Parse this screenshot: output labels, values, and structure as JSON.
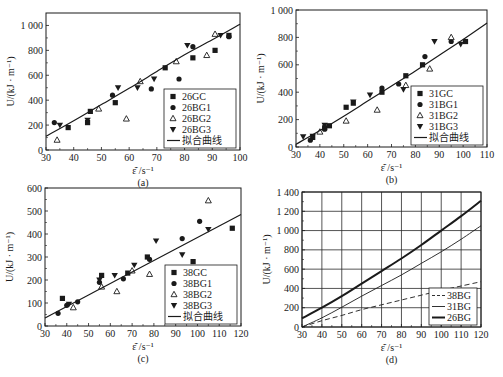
{
  "figure": {
    "panels": [
      "a",
      "b",
      "c",
      "d"
    ]
  },
  "chart_data": [
    {
      "id": "a",
      "type": "scatter",
      "caption": "(a)",
      "xlabel": "ε̄̇ /s⁻¹",
      "ylabel": "U/(kJ · m⁻¹)",
      "xlim": [
        30,
        100
      ],
      "ylim": [
        0,
        1100
      ],
      "xticks": [
        30,
        40,
        50,
        60,
        70,
        80,
        90,
        100
      ],
      "yticks": [
        0,
        200,
        400,
        600,
        800,
        1000
      ],
      "ytick_labels": [
        "0",
        "200",
        "400",
        "600",
        "800",
        "1 000"
      ],
      "frame": {
        "left": 46,
        "top": 13,
        "right": 240,
        "bottom": 150
      },
      "legend": {
        "position": "lower right",
        "entries": [
          "26GC",
          "26BG1",
          "26BG2",
          "26BG3",
          "拟合曲线"
        ]
      },
      "series": [
        {
          "name": "26GC",
          "marker": "square",
          "points": [
            [
              38,
              180
            ],
            [
              45,
              220
            ],
            [
              46,
              310
            ],
            [
              55,
              380
            ],
            [
              73,
              660
            ],
            [
              83,
              740
            ],
            [
              91,
              800
            ],
            [
              96,
              920
            ]
          ]
        },
        {
          "name": "26BG1",
          "marker": "circle",
          "points": [
            [
              33,
              220
            ],
            [
              54,
              440
            ],
            [
              68,
              490
            ],
            [
              78,
              570
            ],
            [
              83,
              830
            ],
            [
              96,
              910
            ]
          ]
        },
        {
          "name": "26BG2",
          "marker": "triangle-up",
          "points": [
            [
              34,
              80
            ],
            [
              49,
              330
            ],
            [
              59,
              250
            ],
            [
              64,
              550
            ],
            [
              77,
              710
            ],
            [
              88,
              760
            ],
            [
              91,
              930
            ]
          ]
        },
        {
          "name": "26BG3",
          "marker": "triangle-down",
          "points": [
            [
              35,
              200
            ],
            [
              45,
              240
            ],
            [
              56,
              500
            ],
            [
              63,
              500
            ],
            [
              69,
              570
            ],
            [
              81,
              840
            ],
            [
              93,
              920
            ]
          ]
        },
        {
          "name": "拟合曲线",
          "marker": "line",
          "points": [
            [
              30,
              110
            ],
            [
              40,
              235
            ],
            [
              50,
              365
            ],
            [
              60,
              495
            ],
            [
              70,
              630
            ],
            [
              80,
              765
            ],
            [
              90,
              885
            ],
            [
              100,
              1010
            ]
          ]
        }
      ]
    },
    {
      "id": "b",
      "type": "scatter",
      "caption": "(b)",
      "xlabel": "ε̄̇ /s⁻¹",
      "ylabel": "U/(kJ · m⁻¹)",
      "xlim": [
        30,
        110
      ],
      "ylim": [
        0,
        1000
      ],
      "xticks": [
        30,
        40,
        50,
        60,
        70,
        80,
        90,
        100,
        110
      ],
      "yticks": [
        0,
        200,
        400,
        600,
        800,
        1000
      ],
      "ytick_labels": [
        "0",
        "200",
        "400",
        "600",
        "800",
        "1 000"
      ],
      "frame": {
        "left": 296,
        "top": 10,
        "right": 487,
        "bottom": 147
      },
      "legend": {
        "position": "lower right",
        "entries": [
          "31GC",
          "31BG1",
          "31BG2",
          "31BG3",
          "拟合曲线"
        ]
      },
      "series": [
        {
          "name": "31GC",
          "marker": "square",
          "points": [
            [
              37,
              70
            ],
            [
              42,
              140
            ],
            [
              44,
              155
            ],
            [
              51,
              290
            ],
            [
              54,
              320
            ],
            [
              66,
              400
            ],
            [
              76,
              520
            ],
            [
              83,
              600
            ],
            [
              101,
              770
            ]
          ]
        },
        {
          "name": "31BG1",
          "marker": "circle",
          "points": [
            [
              36,
              50
            ],
            [
              42,
              130
            ],
            [
              66,
              430
            ],
            [
              73,
              460
            ],
            [
              84,
              660
            ],
            [
              95,
              770
            ]
          ]
        },
        {
          "name": "31BG2",
          "marker": "triangle-up",
          "points": [
            [
              40,
              110
            ],
            [
              51,
              190
            ],
            [
              64,
              270
            ],
            [
              76,
              450
            ],
            [
              86,
              570
            ],
            [
              95,
              800
            ]
          ]
        },
        {
          "name": "31BG3",
          "marker": "triangle-down",
          "points": [
            [
              33,
              75
            ],
            [
              37,
              80
            ],
            [
              42,
              160
            ],
            [
              54,
              330
            ],
            [
              61,
              380
            ],
            [
              75,
              420
            ],
            [
              88,
              770
            ],
            [
              99,
              750
            ]
          ]
        },
        {
          "name": "拟合曲线",
          "marker": "line",
          "points": [
            [
              30,
              20
            ],
            [
              40,
              120
            ],
            [
              50,
              225
            ],
            [
              60,
              335
            ],
            [
              70,
              445
            ],
            [
              80,
              555
            ],
            [
              90,
              670
            ],
            [
              100,
              785
            ],
            [
              110,
              905
            ]
          ]
        }
      ]
    },
    {
      "id": "c",
      "type": "scatter",
      "caption": "(c)",
      "xlabel": "ε̄̇ /s⁻¹",
      "ylabel": "U/(kJ · m⁻¹)",
      "xlim": [
        30,
        120
      ],
      "ylim": [
        0,
        600
      ],
      "xticks": [
        30,
        40,
        50,
        60,
        70,
        80,
        90,
        100,
        110,
        120
      ],
      "yticks": [
        0,
        100,
        200,
        300,
        400,
        500,
        600
      ],
      "ytick_labels": [
        "0",
        "100",
        "200",
        "300",
        "400",
        "500",
        "600"
      ],
      "frame": {
        "left": 45,
        "top": 188,
        "right": 241,
        "bottom": 326
      },
      "legend": {
        "position": "lower right",
        "entries": [
          "38GC",
          "38BG1",
          "38BG2",
          "38BG3",
          "拟合曲线"
        ]
      },
      "series": [
        {
          "name": "38GC",
          "marker": "square",
          "points": [
            [
              38,
              120
            ],
            [
              56,
              220
            ],
            [
              68,
              230
            ],
            [
              77,
              300
            ],
            [
              98,
              280
            ],
            [
              116,
              425
            ]
          ]
        },
        {
          "name": "38BG1",
          "marker": "circle",
          "points": [
            [
              36,
              55
            ],
            [
              40,
              90
            ],
            [
              45,
              105
            ],
            [
              55,
              190
            ],
            [
              66,
              205
            ],
            [
              78,
              290
            ],
            [
              93,
              380
            ],
            [
              101,
              455
            ]
          ]
        },
        {
          "name": "38BG2",
          "marker": "triangle-up",
          "points": [
            [
              43,
              80
            ],
            [
              56,
              170
            ],
            [
              63,
              150
            ],
            [
              70,
              240
            ],
            [
              78,
              225
            ],
            [
              105,
              545
            ]
          ]
        },
        {
          "name": "38BG3",
          "marker": "triangle-down",
          "points": [
            [
              41,
              95
            ],
            [
              55,
              200
            ],
            [
              62,
              220
            ],
            [
              71,
              265
            ],
            [
              81,
              370
            ],
            [
              93,
              310
            ],
            [
              105,
              420
            ]
          ]
        },
        {
          "name": "拟合曲线",
          "marker": "line",
          "points": [
            [
              30,
              35
            ],
            [
              40,
              85
            ],
            [
              50,
              135
            ],
            [
              60,
              185
            ],
            [
              70,
              235
            ],
            [
              80,
              285
            ],
            [
              90,
              335
            ],
            [
              100,
              385
            ],
            [
              110,
              435
            ],
            [
              120,
              485
            ]
          ]
        }
      ]
    },
    {
      "id": "d",
      "type": "line",
      "caption": "(d)",
      "xlabel": "ε̄̇ /s⁻¹",
      "ylabel": "U/(kJ · m⁻¹)",
      "xlim": [
        30,
        120
      ],
      "ylim": [
        0,
        1400
      ],
      "grid": true,
      "xticks": [
        30,
        40,
        50,
        60,
        70,
        80,
        90,
        100,
        110,
        120
      ],
      "yticks": [
        0,
        200,
        400,
        600,
        800,
        1000,
        1200,
        1400
      ],
      "ytick_labels": [
        "0",
        "200",
        "400",
        "600",
        "800",
        "1 000",
        "1 200",
        "1 400"
      ],
      "frame": {
        "left": 302,
        "top": 192,
        "right": 481,
        "bottom": 327
      },
      "legend": {
        "position": "lower right",
        "entries": [
          "38BG",
          "31BG",
          "26BG"
        ]
      },
      "series": [
        {
          "name": "38BG",
          "style": "dashed",
          "points": [
            [
              30,
              0
            ],
            [
              40,
              65
            ],
            [
              50,
              120
            ],
            [
              60,
              180
            ],
            [
              70,
              230
            ],
            [
              80,
              280
            ],
            [
              90,
              330
            ],
            [
              100,
              380
            ],
            [
              110,
              425
            ],
            [
              120,
              470
            ]
          ]
        },
        {
          "name": "31BG",
          "style": "thin",
          "points": [
            [
              30,
              0
            ],
            [
              40,
              95
            ],
            [
              50,
              205
            ],
            [
              60,
              320
            ],
            [
              70,
              430
            ],
            [
              80,
              540
            ],
            [
              90,
              660
            ],
            [
              100,
              780
            ],
            [
              110,
              910
            ],
            [
              120,
              1050
            ]
          ]
        },
        {
          "name": "26BG",
          "style": "thick",
          "points": [
            [
              30,
              90
            ],
            [
              40,
              200
            ],
            [
              50,
              320
            ],
            [
              60,
              450
            ],
            [
              70,
              580
            ],
            [
              80,
              710
            ],
            [
              90,
              850
            ],
            [
              100,
              1000
            ],
            [
              110,
              1150
            ],
            [
              120,
              1310
            ]
          ]
        }
      ]
    }
  ]
}
